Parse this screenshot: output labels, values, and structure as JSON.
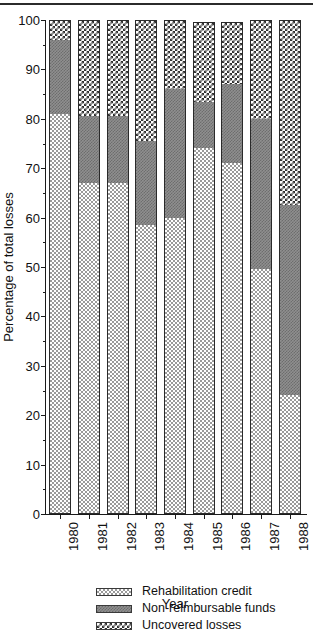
{
  "chart_data": {
    "type": "bar",
    "subtype": "stacked-bar-100-percent",
    "title": "",
    "xlabel": "Year",
    "ylabel": "Percentage of total losses",
    "ylim": [
      0,
      100
    ],
    "ytick_step": 10,
    "ytick_labels": [
      "0",
      "10",
      "20",
      "30",
      "40",
      "50",
      "60",
      "70",
      "80",
      "90",
      "100"
    ],
    "grid": false,
    "legend_position": "bottom",
    "categories": [
      "1980",
      "1981",
      "1982",
      "1983",
      "1984",
      "1985",
      "1986",
      "1987",
      "1988"
    ],
    "series": [
      {
        "name": "Rehabilitation credit",
        "pattern": "light-checker",
        "values": [
          81,
          67,
          67,
          58.5,
          60,
          74,
          71,
          49.5,
          24
        ]
      },
      {
        "name": "Non-reimbursable funds",
        "pattern": "medium-gray",
        "values": [
          15,
          13.5,
          13.5,
          17,
          26,
          9.5,
          16,
          30.5,
          38.5
        ]
      },
      {
        "name": "Uncovered losses",
        "pattern": "dark-checker",
        "values": [
          4,
          19.5,
          19.5,
          24.5,
          14,
          16,
          12.5,
          20,
          37.5
        ]
      }
    ]
  },
  "legend": {
    "items": [
      {
        "label": "Rehabilitation credit",
        "pattern": "light-checker"
      },
      {
        "label": "Non-reimbursable funds",
        "pattern": "medium-gray"
      },
      {
        "label": "Uncovered losses",
        "pattern": "dark-checker"
      }
    ]
  }
}
